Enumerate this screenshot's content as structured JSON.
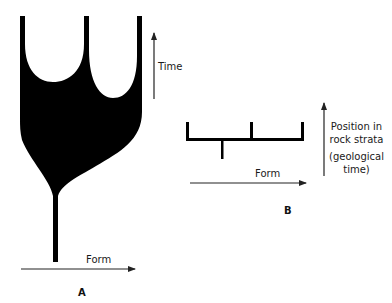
{
  "panels": [
    {
      "id": "A",
      "label": "A",
      "x_axis_label": "Form",
      "y_axis_label": "Time",
      "description": "Black spindle/balloon shape: thin stem at bottom widening into a broad body that splits into three upward stalks forming two U-shaped notches"
    },
    {
      "id": "B",
      "label": "B",
      "x_axis_label": "Form",
      "y_axis_label_lines": [
        "Position in",
        "rock strata",
        "",
        "(geological",
        "time)"
      ],
      "description": "Bracket-shaped line diagram: horizontal bar with three upward ticks at left, middle and right, and one downward stub"
    }
  ],
  "colors": {
    "fill": "#000000",
    "line": "#222222",
    "background": "#ffffff"
  }
}
